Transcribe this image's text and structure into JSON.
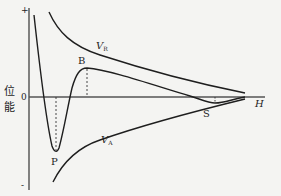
{
  "diagram": {
    "type": "potential-energy-curve",
    "y_axis": {
      "label_line1": "位",
      "label_line2": "能",
      "zero_label": "0",
      "top_sign": "+",
      "bottom_sign": "-"
    },
    "x_axis": {
      "label": "H"
    },
    "curves": {
      "repulsion": {
        "label_main": "V",
        "label_sub": "R"
      },
      "attraction": {
        "label_main": "V",
        "label_sub": "A"
      }
    },
    "points": {
      "barrier": "B",
      "primary_minimum": "P",
      "secondary_minimum": "S"
    },
    "colors": {
      "line": "#1e1e1e",
      "background": "#f4f4f2",
      "axis": "#555555"
    }
  }
}
